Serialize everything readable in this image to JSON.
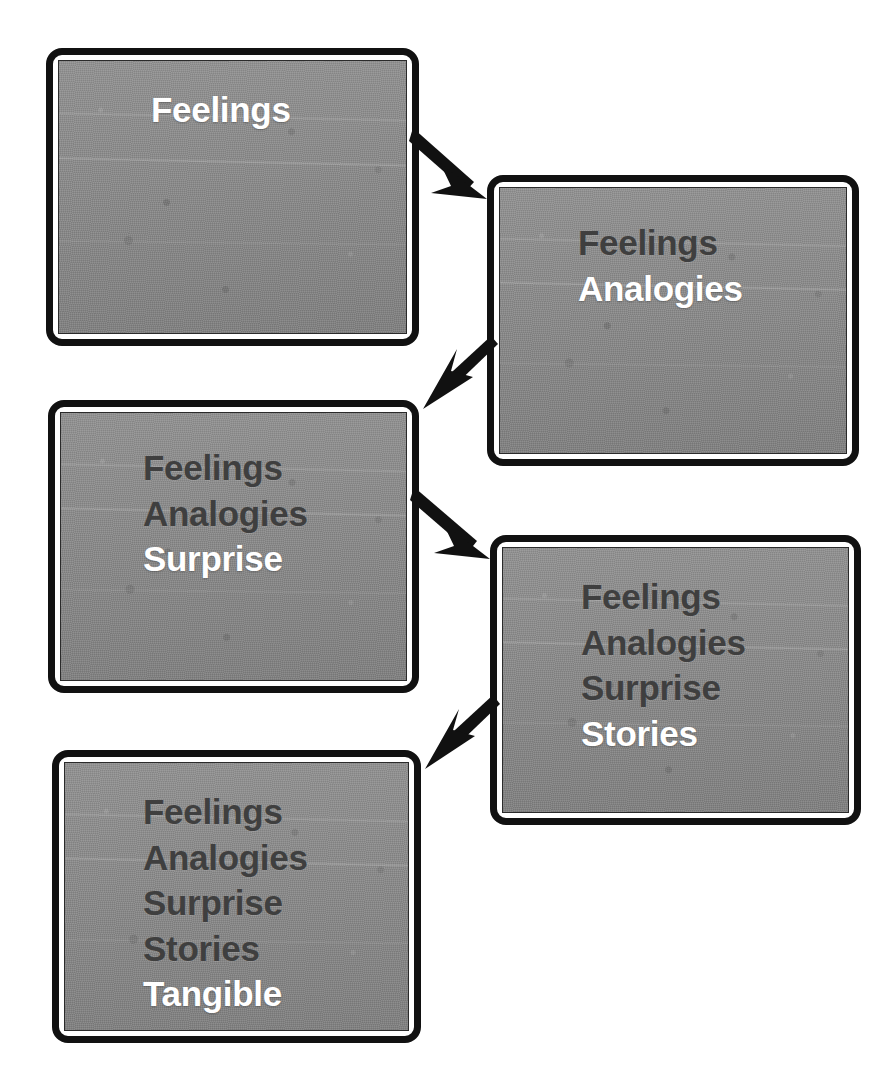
{
  "figure": {
    "kind": "slide-progression-diagram",
    "slide_count": 5,
    "arrow_count": 4,
    "colors": {
      "slide_border": "#111111",
      "slide_inner_border": "#ffffff",
      "slide_background": "#8b8b8b",
      "dim_text": "#3f3f3f",
      "highlight_text": "#ffffff",
      "arrow": "#111111",
      "page_background": "#ffffff"
    }
  },
  "slides": [
    {
      "id": "slide-1",
      "index": 1,
      "lines": [
        {
          "text": "Feelings",
          "state": "highlight"
        }
      ]
    },
    {
      "id": "slide-2",
      "index": 2,
      "lines": [
        {
          "text": "Feelings",
          "state": "dim"
        },
        {
          "text": "Analogies",
          "state": "highlight"
        }
      ]
    },
    {
      "id": "slide-3",
      "index": 3,
      "lines": [
        {
          "text": "Feelings",
          "state": "dim"
        },
        {
          "text": "Analogies",
          "state": "dim"
        },
        {
          "text": "Surprise",
          "state": "highlight"
        }
      ]
    },
    {
      "id": "slide-4",
      "index": 4,
      "lines": [
        {
          "text": "Feelings",
          "state": "dim"
        },
        {
          "text": "Analogies",
          "state": "dim"
        },
        {
          "text": "Surprise",
          "state": "dim"
        },
        {
          "text": "Stories",
          "state": "highlight"
        }
      ]
    },
    {
      "id": "slide-5",
      "index": 5,
      "lines": [
        {
          "text": "Feelings",
          "state": "dim"
        },
        {
          "text": "Analogies",
          "state": "dim"
        },
        {
          "text": "Surprise",
          "state": "dim"
        },
        {
          "text": "Stories",
          "state": "dim"
        },
        {
          "text": "Tangible",
          "state": "highlight"
        }
      ]
    }
  ],
  "arrows": [
    {
      "id": "arrow-1",
      "from": "slide-1",
      "to": "slide-2",
      "direction": "down-right"
    },
    {
      "id": "arrow-2",
      "from": "slide-2",
      "to": "slide-3",
      "direction": "down-left"
    },
    {
      "id": "arrow-3",
      "from": "slide-3",
      "to": "slide-4",
      "direction": "down-right"
    },
    {
      "id": "arrow-4",
      "from": "slide-4",
      "to": "slide-5",
      "direction": "down-left"
    }
  ]
}
